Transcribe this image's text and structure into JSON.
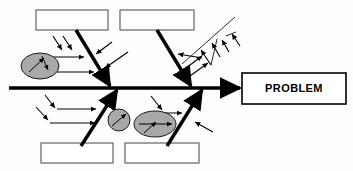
{
  "diagram": {
    "type": "fishbone-ishikawa",
    "title": "",
    "background_color": "#fdfdfd",
    "line_color": "#000000",
    "blob_fill_color": "#a9a9a9",
    "box_stroke_color": "#555555",
    "effect": {
      "label": "PROBLEM",
      "x": 242,
      "y": 73,
      "width": 104,
      "height": 31
    },
    "spine": {
      "x1": 9,
      "y1": 88,
      "x2": 240,
      "y2": 88
    },
    "category_boxes": [
      {
        "name": "top-left-category-box",
        "label": "",
        "x": 36,
        "y": 10,
        "width": 72,
        "height": 20
      },
      {
        "name": "top-right-category-box",
        "label": "",
        "x": 120,
        "y": 10,
        "width": 74,
        "height": 20
      },
      {
        "name": "bottom-left-category-box",
        "label": "",
        "x": 41,
        "y": 143,
        "width": 72,
        "height": 20
      },
      {
        "name": "bottom-right-category-box",
        "label": "",
        "x": 125,
        "y": 143,
        "width": 74,
        "height": 20
      }
    ],
    "ribs": [
      {
        "name": "rib-top-left",
        "x1": 76,
        "y1": 30,
        "x2": 110,
        "y2": 88
      },
      {
        "name": "rib-top-right",
        "x1": 157,
        "y1": 30,
        "x2": 192,
        "y2": 88
      },
      {
        "name": "rib-bottom-left",
        "x1": 81,
        "y1": 146,
        "x2": 118,
        "y2": 88
      },
      {
        "name": "rib-bottom-right",
        "x1": 167,
        "y1": 146,
        "x2": 202,
        "y2": 88
      },
      {
        "name": "rib-upper-right-extra",
        "x1": 186,
        "y1": 60,
        "x2": 232,
        "y2": 20
      }
    ],
    "cause_blobs": [
      {
        "name": "cause-blob-left",
        "cx": 40,
        "cy": 66,
        "rx": 19,
        "ry": 13
      },
      {
        "name": "cause-blob-center",
        "cx": 119,
        "cy": 120,
        "rx": 11,
        "ry": 11
      },
      {
        "name": "cause-blob-lower-right",
        "cx": 155,
        "cy": 124,
        "rx": 21,
        "ry": 13
      }
    ],
    "sub_cause_arrow_count": 18
  }
}
